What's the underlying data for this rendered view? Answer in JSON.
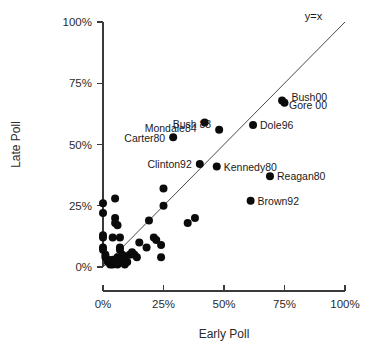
{
  "chart_data": {
    "type": "scatter",
    "title": "",
    "xlabel": "Early Poll",
    "ylabel": "Late Poll",
    "xlim": [
      0,
      100
    ],
    "ylim": [
      0,
      100
    ],
    "grid": false,
    "legend": "none",
    "xticks": [
      "0%",
      "25%",
      "50%",
      "75%",
      "100%"
    ],
    "xtick_values": [
      0,
      25,
      50,
      75,
      100
    ],
    "yticks": [
      "0%",
      "25%",
      "50%",
      "75%",
      "100%"
    ],
    "ytick_values": [
      0,
      25,
      50,
      75,
      100
    ],
    "annotations": [
      {
        "text": "y=x",
        "x": 87,
        "y": 101,
        "kind": "reference-line-label"
      }
    ],
    "reference_line": {
      "label": "y=x",
      "from": [
        0,
        0
      ],
      "to": [
        100,
        100
      ]
    },
    "labeled_points": [
      {
        "label": "Gore 00",
        "x": 74,
        "y": 68,
        "label_dx": 7,
        "label_dy": 5
      },
      {
        "label": "Bush00",
        "x": 75,
        "y": 67,
        "label_dx": 7,
        "label_dy": -6
      },
      {
        "label": "Dole96",
        "x": 62,
        "y": 58,
        "label_dx": 7,
        "label_dy": 0
      },
      {
        "label": "Mondale84",
        "x": 42,
        "y": 59,
        "label_dx": -8,
        "label_dy": 6
      },
      {
        "label": "Bush 88",
        "x": 48,
        "y": 56,
        "label_dx": -8,
        "label_dy": -6
      },
      {
        "label": "Carter80",
        "x": 29,
        "y": 53,
        "label_dx": -8,
        "label_dy": 1
      },
      {
        "label": "Clinton92",
        "x": 40,
        "y": 42,
        "label_dx": -8,
        "label_dy": 0
      },
      {
        "label": "Kennedy80",
        "x": 47,
        "y": 41,
        "label_dx": 7,
        "label_dy": 0
      },
      {
        "label": "Reagan80",
        "x": 69,
        "y": 37,
        "label_dx": 7,
        "label_dy": 0
      },
      {
        "label": "Brown92",
        "x": 61,
        "y": 27,
        "label_dx": 7,
        "label_dy": 0
      }
    ],
    "unlabeled_points": [
      {
        "x": 0,
        "y": 26
      },
      {
        "x": 0,
        "y": 22
      },
      {
        "x": 5,
        "y": 28
      },
      {
        "x": 0,
        "y": 13
      },
      {
        "x": 0,
        "y": 12
      },
      {
        "x": 5,
        "y": 20
      },
      {
        "x": 5,
        "y": 18
      },
      {
        "x": 6,
        "y": 17
      },
      {
        "x": 0,
        "y": 8
      },
      {
        "x": 0,
        "y": 7
      },
      {
        "x": 4,
        "y": 12
      },
      {
        "x": 7,
        "y": 12
      },
      {
        "x": 1,
        "y": 5
      },
      {
        "x": 1,
        "y": 4
      },
      {
        "x": 2,
        "y": 3
      },
      {
        "x": 2,
        "y": 2
      },
      {
        "x": 3,
        "y": 2
      },
      {
        "x": 3,
        "y": 1
      },
      {
        "x": 4,
        "y": 1
      },
      {
        "x": 4,
        "y": 3
      },
      {
        "x": 5,
        "y": 2
      },
      {
        "x": 6,
        "y": 1
      },
      {
        "x": 6,
        "y": 4
      },
      {
        "x": 7,
        "y": 7
      },
      {
        "x": 7,
        "y": 8
      },
      {
        "x": 8,
        "y": 2
      },
      {
        "x": 8,
        "y": 5
      },
      {
        "x": 9,
        "y": 1
      },
      {
        "x": 9,
        "y": 3
      },
      {
        "x": 10,
        "y": 2
      },
      {
        "x": 11,
        "y": 5
      },
      {
        "x": 12,
        "y": 6
      },
      {
        "x": 13,
        "y": 5
      },
      {
        "x": 14,
        "y": 4
      },
      {
        "x": 15,
        "y": 10
      },
      {
        "x": 18,
        "y": 8
      },
      {
        "x": 19,
        "y": 19
      },
      {
        "x": 21,
        "y": 12
      },
      {
        "x": 22,
        "y": 11
      },
      {
        "x": 24,
        "y": 9
      },
      {
        "x": 24,
        "y": 4
      },
      {
        "x": 25,
        "y": 32
      },
      {
        "x": 25,
        "y": 25
      },
      {
        "x": 35,
        "y": 18
      },
      {
        "x": 38,
        "y": 20
      }
    ]
  },
  "axes": {
    "x_axis_name": "Early Poll",
    "y_axis_name": "Late Poll"
  }
}
